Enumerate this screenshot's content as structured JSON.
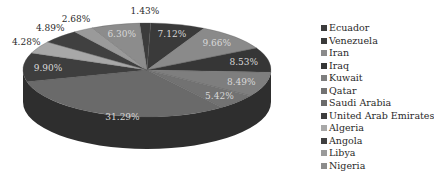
{
  "chart_data": {
    "type": "pie",
    "style": "3d-exploded-none",
    "title": "",
    "legend_position": "right",
    "categories": [
      "Ecuador",
      "Venezuela",
      "Iran",
      "Iraq",
      "Kuwait",
      "Qatar",
      "Saudi Arabia",
      "United Arab Emirates",
      "Algeria",
      "Angola",
      "Libya",
      "Nigeria"
    ],
    "values": [
      1.43,
      7.12,
      9.66,
      8.53,
      8.49,
      5.42,
      31.29,
      9.9,
      4.28,
      4.89,
      2.68,
      6.3
    ],
    "labels": [
      "1.43%",
      "7.12%",
      "9.66%",
      "8.53%",
      "8.49%",
      "5.42%",
      "31.29%",
      "9.90%",
      "4.28%",
      "4.89%",
      "2.68%",
      "6.30%"
    ],
    "colors": [
      "#3c3c3c",
      "#3a3a3a",
      "#8a8a8a",
      "#363636",
      "#7e7e7e",
      "#727272",
      "#6a6a6a",
      "#3e3e3e",
      "#a8a8a8",
      "#404040",
      "#9a9a9a",
      "#8c8c8c"
    ],
    "side_color": "#2e2e2e"
  },
  "legend": {
    "items": [
      {
        "label": "Ecuador",
        "color": "#3c3c3c"
      },
      {
        "label": "Venezuela",
        "color": "#3a3a3a"
      },
      {
        "label": "Iran",
        "color": "#8a8a8a"
      },
      {
        "label": "Iraq",
        "color": "#363636"
      },
      {
        "label": "Kuwait",
        "color": "#7e7e7e"
      },
      {
        "label": "Qatar",
        "color": "#727272"
      },
      {
        "label": "Saudi Arabia",
        "color": "#6a6a6a"
      },
      {
        "label": "United Arab Emirates",
        "color": "#3e3e3e"
      },
      {
        "label": "Algeria",
        "color": "#a8a8a8"
      },
      {
        "label": "Angola",
        "color": "#404040"
      },
      {
        "label": "Libya",
        "color": "#9a9a9a"
      },
      {
        "label": "Nigeria",
        "color": "#8c8c8c"
      }
    ]
  }
}
